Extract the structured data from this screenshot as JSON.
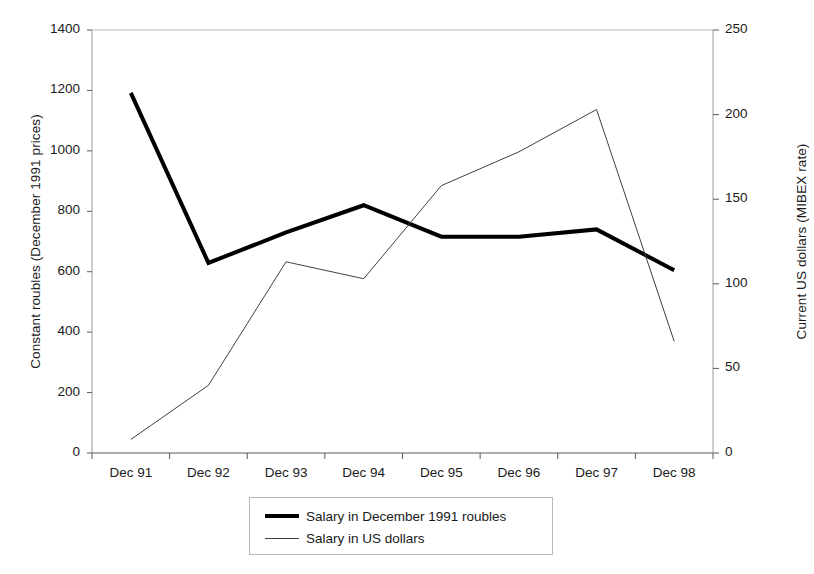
{
  "chart_data": {
    "type": "line",
    "title": "",
    "xlabel": "",
    "categories": [
      "Dec 91",
      "Dec 92",
      "Dec 93",
      "Dec 94",
      "Dec 95",
      "Dec 96",
      "Dec 97",
      "Dec 98"
    ],
    "grid": false,
    "legend_position": "bottom-center",
    "axes": {
      "left": {
        "label": "Constant roubles (December 1991 prices)",
        "ylim": [
          0,
          1400
        ],
        "ticks": [
          0,
          200,
          400,
          600,
          800,
          1000,
          1200,
          1400
        ],
        "tick_labels": [
          "0",
          "200",
          "400",
          "600",
          "800",
          "1000",
          "1200",
          "1400"
        ]
      },
      "right": {
        "label": "Current US dollars (MIBEX rate)",
        "ylim": [
          0,
          250
        ],
        "ticks": [
          0,
          50,
          100,
          150,
          200,
          250
        ],
        "tick_labels": [
          "0",
          "50",
          "100",
          "150",
          "200",
          "250"
        ]
      }
    },
    "series": [
      {
        "name": "Salary in December 1991 roubles",
        "axis": "left",
        "color": "#000000",
        "line_width": 4,
        "values": [
          1192,
          629,
          730,
          820,
          716,
          716,
          740,
          605
        ]
      },
      {
        "name": "Salary in US dollars",
        "axis": "right",
        "color": "#404040",
        "line_width": 1,
        "values": [
          8,
          40,
          113,
          103,
          158,
          178,
          203,
          66
        ]
      }
    ]
  },
  "legend": {
    "items": [
      {
        "label": "Salary in December 1991 roubles",
        "style": "thick"
      },
      {
        "label": "Salary in US dollars",
        "style": "thin"
      }
    ]
  }
}
